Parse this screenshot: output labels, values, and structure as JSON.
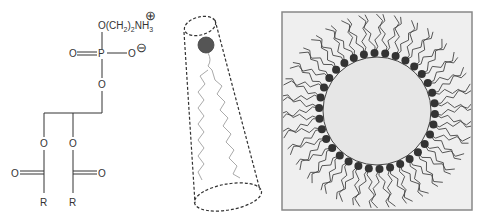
{
  "figure": {
    "panels": [
      {
        "id": "structure",
        "description": "Phosphatidylethanolamine chemical structure",
        "labels": {
          "headgroup": "O(CH",
          "headgroup_sub1": "2",
          "headgroup_mid": ")",
          "headgroup_sub2": "2",
          "headgroup_tail": "NH",
          "headgroup_sub3": "3",
          "positive_charge": "⊕",
          "phosphorus": "P",
          "oxygen_double": "O",
          "oxygen_anion": "O",
          "negative_charge": "⊖",
          "oxygen_bridge": "O",
          "ester_oxygen_1": "O",
          "ester_oxygen_2": "O",
          "carbonyl_oxygen_1": "O",
          "carbonyl_oxygen_2": "O",
          "r_group_1": "R",
          "r_group_2": "R"
        }
      },
      {
        "id": "cone",
        "description": "Cone-shaped lipid with head group and two wavy tails inside dashed cone"
      },
      {
        "id": "micelle",
        "description": "Inverted micelle: circle surrounded by lipid head groups with tails pointing outward"
      }
    ],
    "colors": {
      "line": "#333333",
      "head_fill": "#555555",
      "tail_gray": "#aaaaaa",
      "micelle_core": "#e6e6e6",
      "micelle_box_bg": "#efefef",
      "micelle_box_border": "#888888"
    }
  }
}
